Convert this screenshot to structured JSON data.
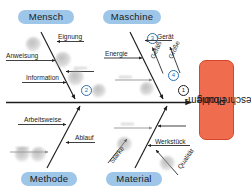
{
  "diagram": {
    "type": "fishbone",
    "effect": {
      "line1": "Problem-",
      "line2": "beschreibung",
      "color": "#EF6C4F"
    },
    "category_color": "#9DC6E8",
    "categories": [
      {
        "id": "mensch",
        "label": "Mensch",
        "position": "top-left"
      },
      {
        "id": "maschine",
        "label": "Maschine",
        "position": "top-right"
      },
      {
        "id": "methode",
        "label": "Methode",
        "position": "bottom-left"
      },
      {
        "id": "material",
        "label": "Material",
        "position": "bottom-right"
      }
    ],
    "causes": {
      "mensch": [
        "Eignung",
        "Anweisung",
        "Information"
      ],
      "maschine": [
        "Energie",
        "Gerät",
        "Gefäß",
        "Größe"
      ],
      "methode": [
        "Arbeitsweise",
        "Ablauf"
      ],
      "material": [
        "Stärke",
        "Werkstück",
        "Qualität"
      ]
    },
    "markers": [
      {
        "n": "1",
        "style": "dark"
      },
      {
        "n": "2",
        "style": "blue"
      },
      {
        "n": "3",
        "style": "blue"
      },
      {
        "n": "4",
        "style": "blue"
      }
    ],
    "obscured_labels": [
      "•••••",
      "•••••",
      "•••••",
      "•••••"
    ]
  }
}
